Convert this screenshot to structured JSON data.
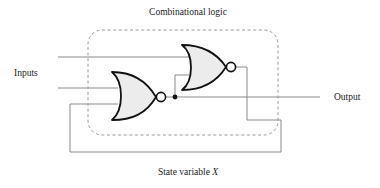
{
  "figure": {
    "type": "logic-circuit-diagram",
    "background_color": "#ffffff",
    "title_label": "Combinational logic",
    "bottom_label_prefix": "State variable ",
    "bottom_label_variable": "X",
    "inputs_label": "Inputs",
    "output_label": "Output"
  },
  "colors": {
    "wire": "#8a8a8a",
    "gate_outline": "#111111",
    "gate_fill": "#ececec",
    "bubble_fill": "#ffffff",
    "boundary_dashed": "#9a9a9a",
    "text": "#1a1a1a",
    "junction_dot": "#111111"
  },
  "boundary": {
    "name": "combinational-logic-boundary",
    "style": "dashed rounded rectangle",
    "x": 88,
    "y": 30,
    "width": 190,
    "height": 105,
    "corner_radius": 14
  },
  "gates": [
    {
      "id": "nor-gate-lower",
      "type": "NOR",
      "inputs": 3,
      "x": 110,
      "y": 72,
      "width": 46,
      "height": 48,
      "bubble_cx": 161,
      "bubble_cy": 97,
      "bubble_r": 4.6
    },
    {
      "id": "nor-gate-upper",
      "type": "NOR",
      "inputs": 2,
      "x": 180,
      "y": 45,
      "width": 46,
      "height": 46,
      "bubble_cx": 231,
      "bubble_cy": 67,
      "bubble_r": 4.6
    }
  ],
  "nodes": [
    {
      "id": "state-variable-junction",
      "label": "X",
      "cx": 175,
      "cy": 97,
      "r": 2.4
    }
  ],
  "wires": [
    {
      "id": "input-wire-top",
      "path": "M58,57 L193,57"
    },
    {
      "id": "input-wire-bottom",
      "path": "M58,88 L118,88"
    },
    {
      "id": "lower-gate-input-feedback",
      "path": "M70,104 L118,104"
    },
    {
      "id": "output-wire",
      "path": "M175,97 L320,97"
    },
    {
      "id": "state-feedback-branch-up",
      "path": "M175,97 L175,75 L191,75"
    },
    {
      "id": "upper-output-feedback",
      "path": "M236,67 L247,67 L247,120 L281,120 L281,152 L70,152 L70,104"
    }
  ],
  "text_labels": [
    {
      "id": "title",
      "text": "Combinational logic",
      "x": 188,
      "y": 15,
      "anchor": "middle"
    },
    {
      "id": "inputs",
      "text": "Inputs",
      "x": 14,
      "y": 76,
      "anchor": "start"
    },
    {
      "id": "output",
      "text": "Output",
      "x": 334,
      "y": 100,
      "anchor": "start"
    },
    {
      "id": "state",
      "text": "State variable X",
      "x": 188,
      "y": 175,
      "anchor": "middle"
    }
  ]
}
